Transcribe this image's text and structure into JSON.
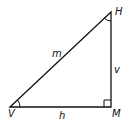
{
  "diagram": {
    "type": "right-triangle",
    "vertices": [
      {
        "name": "V",
        "x": 10,
        "y": 107
      },
      {
        "name": "H",
        "x": 111,
        "y": 12
      },
      {
        "name": "M",
        "x": 111,
        "y": 107
      }
    ],
    "sides": [
      {
        "label": "m",
        "from": "V",
        "to": "H"
      },
      {
        "label": "h",
        "from": "V",
        "to": "M"
      },
      {
        "label": "v",
        "from": "M",
        "to": "H"
      }
    ],
    "right_angle_at": "M",
    "angle_marks": [
      "V",
      "H"
    ]
  },
  "labels": {
    "V": "V",
    "H": "H",
    "M": "M",
    "m": "m",
    "h": "h",
    "v": "v"
  },
  "colors": {
    "stroke": "#111111",
    "background": "#ffffff"
  }
}
